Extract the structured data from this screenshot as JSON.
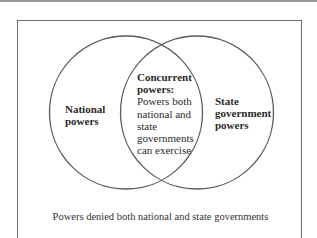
{
  "diagram": {
    "type": "venn",
    "colors": {
      "stroke": "#5a5a5a",
      "frame": "#6a6a6a",
      "text": "#2b2b2b",
      "background": "#ffffff"
    },
    "sets": {
      "left": {
        "title_line1": "National",
        "title_line2": "powers"
      },
      "right": {
        "title_line1": "State",
        "title_line2": "government",
        "title_line3": "powers"
      },
      "intersection": {
        "title_line1": "Concurrent",
        "title_line2": "powers:",
        "desc_line1": "Powers both",
        "desc_line2": "national and",
        "desc_line3": "state",
        "desc_line4": "governments",
        "desc_line5": "can exercise"
      }
    },
    "outside_label": "Powers denied both national and state governments"
  }
}
